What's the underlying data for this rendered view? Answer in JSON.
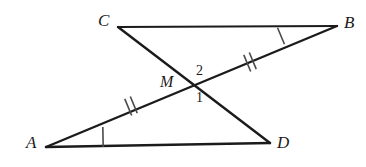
{
  "figure": {
    "background_color": "#ffffff",
    "stroke_color": "#1b1b1b",
    "tick_color": "#4a4a4a",
    "width": 366,
    "height": 167
  },
  "vertices": {
    "C": {
      "label": "C",
      "x": 118,
      "y": 27,
      "label_x": 98,
      "label_y": 12
    },
    "B": {
      "label": "B",
      "x": 337,
      "y": 26,
      "label_x": 344,
      "label_y": 14
    },
    "A": {
      "label": "A",
      "x": 46,
      "y": 147,
      "label_x": 26,
      "label_y": 134
    },
    "D": {
      "label": "D",
      "x": 270,
      "y": 143,
      "label_x": 277,
      "label_y": 134
    },
    "M": {
      "label": "M",
      "x": 192,
      "y": 86,
      "label_x": 160,
      "label_y": 74
    }
  },
  "angle_labels": [
    {
      "name": "angle-2",
      "label": "2",
      "x": 196,
      "y": 64
    },
    {
      "name": "angle-1",
      "label": "1",
      "x": 196,
      "y": 91
    }
  ],
  "segments": [
    {
      "name": "segment-CB",
      "from": "C",
      "to": "B",
      "x1": 118,
      "y1": 27,
      "x2": 337,
      "y2": 26
    },
    {
      "name": "segment-AD",
      "from": "A",
      "to": "D",
      "x1": 46,
      "y1": 147,
      "x2": 270,
      "y2": 143
    },
    {
      "name": "segment-AB",
      "from": "A",
      "to": "B",
      "x1": 46,
      "y1": 147,
      "x2": 337,
      "y2": 26
    },
    {
      "name": "segment-CD",
      "from": "C",
      "to": "D",
      "x1": 118,
      "y1": 27,
      "x2": 270,
      "y2": 143
    }
  ],
  "tick_marks": [
    {
      "name": "tick-MB-single",
      "on_segment": "segment-AB",
      "count": 1,
      "x": 281,
      "y": 36
    },
    {
      "name": "tick-MB-double",
      "on_segment": "segment-AB",
      "count": 2,
      "x": 250,
      "y": 62
    },
    {
      "name": "tick-AM-double",
      "on_segment": "segment-AB",
      "count": 2,
      "x": 131,
      "y": 106
    },
    {
      "name": "tick-AD-single",
      "on_segment": "segment-AD",
      "count": 1,
      "x": 103,
      "y": 137
    }
  ]
}
